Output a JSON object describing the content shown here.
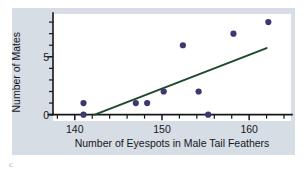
{
  "chart_data": {
    "type": "scatter",
    "title": "",
    "xlabel": "Number of Eyespots in Male Tail Feathers",
    "ylabel": "Number of Mates",
    "xlim": [
      137.5,
      164.8
    ],
    "ylim": [
      -0.55,
      8.7
    ],
    "xticks": [
      140,
      150,
      160
    ],
    "xtick_labels": [
      "140",
      "150",
      "160"
    ],
    "yticks": [
      0,
      5
    ],
    "ytick_labels": [
      "0",
      "5"
    ],
    "x_minor_tick_step": 2,
    "y_minor_tick_step": 1,
    "grid": false,
    "legend": false,
    "points": [
      {
        "x": 141.0,
        "y": 1.0
      },
      {
        "x": 141.0,
        "y": 0.0
      },
      {
        "x": 147.0,
        "y": 1.0
      },
      {
        "x": 148.3,
        "y": 1.0
      },
      {
        "x": 150.2,
        "y": 2.0
      },
      {
        "x": 152.4,
        "y": 6.0
      },
      {
        "x": 154.2,
        "y": 2.0
      },
      {
        "x": 155.3,
        "y": 0.0
      },
      {
        "x": 158.2,
        "y": 7.0
      },
      {
        "x": 162.2,
        "y": 8.0
      }
    ],
    "trend_line": {
      "x_start": 142.3,
      "y_start": 0.0,
      "x_end": 162.0,
      "y_end": 5.75,
      "color": "#1e4a2e"
    },
    "point_color": "#3b3970",
    "plot_background": "#ffffff",
    "panel_background": "#d6dde4",
    "axis_color": "#16161d"
  },
  "figure": {
    "corner_mark": "c"
  }
}
